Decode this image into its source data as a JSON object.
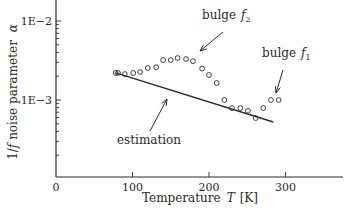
{
  "chart_data": {
    "type": "scatter",
    "title": "",
    "xlabel": "Temperature  T [K]",
    "xlabel_parts": {
      "prefix": "Temperature",
      "var": "T",
      "unit": "[K]"
    },
    "ylabel": "1/f noise parameter α",
    "ylabel_parts": {
      "prefix": "1/",
      "f": "f",
      "mid": " noise parameter ",
      "var": "α"
    },
    "xlim": [
      0,
      380
    ],
    "ylim": [
      0.0001,
      0.0125
    ],
    "yscale": "log",
    "grid": false,
    "legend": null,
    "x_ticks": [
      {
        "value": 0,
        "label": "0"
      },
      {
        "value": 100,
        "label": "100"
      },
      {
        "value": 200,
        "label": "200"
      },
      {
        "value": 300,
        "label": "300"
      }
    ],
    "y_ticks": [
      {
        "value": 0.01,
        "label": "1E−2"
      },
      {
        "value": 0.001,
        "label": "1E−3"
      }
    ],
    "series": [
      {
        "name": "measured",
        "marker": "open-circle",
        "x": [
          78,
          81,
          90,
          101,
          110,
          120,
          131,
          140,
          150,
          159,
          170,
          179,
          191,
          200,
          210,
          220,
          230,
          241,
          251,
          261,
          271,
          281,
          291
        ],
        "y": [
          0.0022,
          0.0022,
          0.00213,
          0.0022,
          0.00226,
          0.00254,
          0.0026,
          0.0032,
          0.0032,
          0.0034,
          0.0033,
          0.0031,
          0.0025,
          0.00207,
          0.00164,
          0.001,
          0.00079,
          0.00079,
          0.00073,
          0.00059,
          0.00079,
          0.001,
          0.001
        ]
      },
      {
        "name": "estimation",
        "marker": "line",
        "x": [
          78,
          284
        ],
        "y": [
          0.0022,
          0.000527
        ]
      }
    ],
    "annotations": [
      {
        "text": "bulge",
        "sub_var": "f",
        "sub": "2",
        "label": "bulge f2",
        "text_x": 202,
        "text_y": 19,
        "arrow_from": [
          223,
          32
        ],
        "arrow_to": [
          200,
          51
        ]
      },
      {
        "text": "bulge",
        "sub_var": "f",
        "sub": "1",
        "label": "bulge f1",
        "text_x": 262,
        "text_y": 57,
        "arrow_from": [
          283,
          70
        ],
        "arrow_to": [
          276,
          93
        ]
      },
      {
        "text": "estimation",
        "label": "estimation",
        "text_x": 117,
        "text_y": 144,
        "arrow_from": [
          150,
          131
        ],
        "arrow_to": [
          167,
          99
        ]
      }
    ]
  },
  "colors": {
    "ink": "#2a2a2a",
    "background": "#ffffff"
  }
}
